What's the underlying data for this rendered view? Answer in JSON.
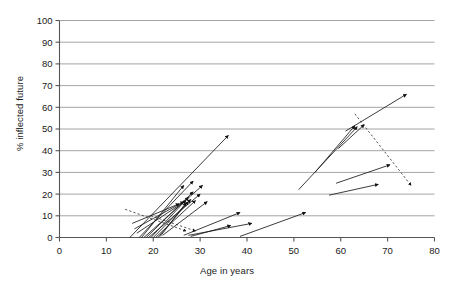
{
  "chart_data": {
    "type": "scatter",
    "title": "",
    "xlabel": "Age in years",
    "ylabel": "% inflected future",
    "xlim": [
      0,
      80
    ],
    "ylim": [
      0,
      100
    ],
    "xticks": [
      0,
      10,
      20,
      30,
      40,
      50,
      60,
      70,
      80
    ],
    "yticks": [
      0,
      10,
      20,
      30,
      40,
      50,
      60,
      70,
      80,
      90,
      100
    ],
    "grid": "horizontal",
    "legend": "none",
    "marker": "arrow",
    "series": [
      {
        "name": "solid-arrows",
        "style": "solid",
        "arrows": [
          {
            "x1": 15.0,
            "y1": 0.0,
            "x2": 36.0,
            "y2": 47.0
          },
          {
            "x1": 17.0,
            "y1": 0.0,
            "x2": 28.5,
            "y2": 26.0
          },
          {
            "x1": 17.5,
            "y1": 0.0,
            "x2": 26.5,
            "y2": 24.0
          },
          {
            "x1": 18.0,
            "y1": 0.0,
            "x2": 30.5,
            "y2": 24.0
          },
          {
            "x1": 18.5,
            "y1": 0.0,
            "x2": 28.5,
            "y2": 21.0
          },
          {
            "x1": 19.0,
            "y1": 0.0,
            "x2": 30.0,
            "y2": 20.0
          },
          {
            "x1": 19.5,
            "y1": 0.0,
            "x2": 27.5,
            "y2": 18.5
          },
          {
            "x1": 20.0,
            "y1": 0.0,
            "x2": 28.0,
            "y2": 17.5
          },
          {
            "x1": 20.5,
            "y1": 0.0,
            "x2": 29.0,
            "y2": 17.0
          },
          {
            "x1": 21.0,
            "y1": 0.0,
            "x2": 27.5,
            "y2": 16.5
          },
          {
            "x1": 21.5,
            "y1": 0.5,
            "x2": 27.0,
            "y2": 16.0
          },
          {
            "x1": 22.0,
            "y1": 1.0,
            "x2": 31.5,
            "y2": 16.5
          },
          {
            "x1": 16.5,
            "y1": 2.0,
            "x2": 27.0,
            "y2": 17.0
          },
          {
            "x1": 16.0,
            "y1": 4.0,
            "x2": 26.5,
            "y2": 16.5
          },
          {
            "x1": 15.5,
            "y1": 6.5,
            "x2": 25.5,
            "y2": 15.5
          },
          {
            "x1": 26.5,
            "y1": 1.0,
            "x2": 38.5,
            "y2": 11.5
          },
          {
            "x1": 27.5,
            "y1": 1.0,
            "x2": 41.0,
            "y2": 6.5
          },
          {
            "x1": 28.0,
            "y1": 0.5,
            "x2": 36.5,
            "y2": 5.5
          },
          {
            "x1": 38.5,
            "y1": 0.5,
            "x2": 52.5,
            "y2": 11.5
          },
          {
            "x1": 51.0,
            "y1": 22.0,
            "x2": 63.5,
            "y2": 51.0
          },
          {
            "x1": 54.5,
            "y1": 30.0,
            "x2": 63.0,
            "y2": 51.5
          },
          {
            "x1": 59.5,
            "y1": 41.0,
            "x2": 65.0,
            "y2": 52.0
          },
          {
            "x1": 61.0,
            "y1": 49.0,
            "x2": 74.0,
            "y2": 66.0
          },
          {
            "x1": 59.0,
            "y1": 25.0,
            "x2": 70.5,
            "y2": 33.5
          },
          {
            "x1": 57.5,
            "y1": 19.5,
            "x2": 68.0,
            "y2": 24.5
          }
        ]
      },
      {
        "name": "dashed-arrows",
        "style": "dashed",
        "arrows": [
          {
            "x1": 14.0,
            "y1": 13.0,
            "x2": 27.0,
            "y2": 3.0
          },
          {
            "x1": 19.5,
            "y1": 10.0,
            "x2": 29.0,
            "y2": 3.0
          },
          {
            "x1": 63.0,
            "y1": 57.0,
            "x2": 75.0,
            "y2": 24.0
          }
        ]
      }
    ]
  },
  "colors": {
    "grid": "#9a9a9a",
    "axis": "#555555",
    "arrow": "#1a1a1a",
    "background": "#ffffff"
  }
}
